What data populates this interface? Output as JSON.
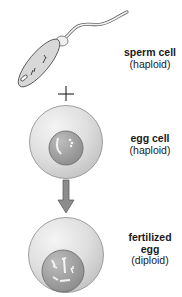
{
  "diagram": {
    "type": "fertilization",
    "stages": [
      {
        "id": "sperm",
        "name": "sperm cell",
        "ploidy": "(haploid)"
      },
      {
        "id": "egg",
        "name": "egg cell",
        "ploidy": "(haploid)"
      },
      {
        "id": "zygote",
        "name_line1": "fertilized",
        "name_line2": "egg",
        "ploidy": "(diploid)"
      }
    ],
    "operator": "+",
    "colors": {
      "cell_fill": "#dcdcdc",
      "cell_outline": "#7a7a7a",
      "nucleus_fill": "#9a9a9a",
      "arrow_fill": "#8c8c8c",
      "text": "#1a1a1a"
    }
  }
}
